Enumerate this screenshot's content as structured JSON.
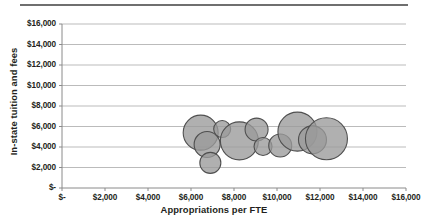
{
  "chart_data": {
    "type": "scatter",
    "subtype": "bubble",
    "title": "",
    "xlabel": "Appropriations per FTE",
    "ylabel": "In-state tuition and fees",
    "xlim": [
      0,
      16000
    ],
    "ylim": [
      0,
      16000
    ],
    "xticks": [
      0,
      2000,
      4000,
      6000,
      8000,
      10000,
      12000,
      14000,
      16000
    ],
    "yticks": [
      0,
      2000,
      4000,
      6000,
      8000,
      10000,
      12000,
      14000,
      16000
    ],
    "xtick_labels": [
      "$-",
      "$2,000",
      "$4,000",
      "$6,000",
      "$8,000",
      "$10,000",
      "$12,000",
      "$14,000",
      "$16,000"
    ],
    "ytick_labels": [
      "$-",
      "$2,000",
      "$4,000",
      "$6,000",
      "$8,000",
      "$10,000",
      "$12,000",
      "$14,000",
      "$16,000"
    ],
    "grid": "horizontal",
    "legend": "none",
    "marker_fill": "#9a9a9a",
    "marker_stroke": "#4f4f4f",
    "marker_opacity": 0.78,
    "points": [
      {
        "x": 6450,
        "y": 5400,
        "r": 17.5
      },
      {
        "x": 6750,
        "y": 4250,
        "r": 13.0
      },
      {
        "x": 6900,
        "y": 2450,
        "r": 10.5
      },
      {
        "x": 7450,
        "y": 5750,
        "r": 8.5
      },
      {
        "x": 8250,
        "y": 4600,
        "r": 19.0
      },
      {
        "x": 9050,
        "y": 5700,
        "r": 11.5
      },
      {
        "x": 9350,
        "y": 4050,
        "r": 9.0
      },
      {
        "x": 10150,
        "y": 4150,
        "r": 11.5
      },
      {
        "x": 10950,
        "y": 5500,
        "r": 19.5
      },
      {
        "x": 11650,
        "y": 4700,
        "r": 14.0
      },
      {
        "x": 12300,
        "y": 4800,
        "r": 21.0
      }
    ]
  },
  "axes": {
    "x_title": "Appropriations per FTE",
    "y_title": "In-state tuition and fees"
  }
}
